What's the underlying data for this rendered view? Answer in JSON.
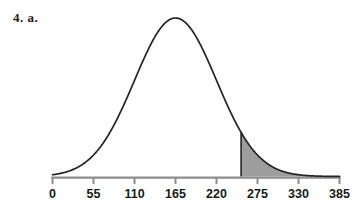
{
  "problem": {
    "label": "4. a."
  },
  "colors": {
    "curve_stroke": "#242424",
    "axis": "#8d8d8d",
    "tick": "#8d8d8d",
    "shade_fill": "#9d9d9d",
    "shade_edge": "#242424",
    "text": "#1a1a1a",
    "background": "#ffffff"
  },
  "chart_data": {
    "type": "line",
    "title": "",
    "subtitle": "",
    "xlabel": "",
    "ylabel": "",
    "curve": "normal",
    "mean": 165,
    "std_dev": 55,
    "xlim": [
      0,
      385
    ],
    "ylim": [
      0,
      1
    ],
    "grid": false,
    "legend": null,
    "tick_values": [
      0,
      55,
      110,
      165,
      220,
      275,
      330,
      385
    ],
    "tick_labels": [
      "0",
      "55",
      "110",
      "165",
      "220",
      "275",
      "330",
      "385"
    ],
    "shaded_region": {
      "from": 253,
      "to": 385,
      "direction": "right-tail",
      "fill": "#9d9d9d",
      "label": ""
    },
    "annotations": []
  }
}
